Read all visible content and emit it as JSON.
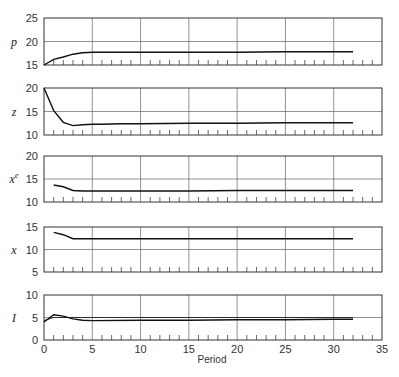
{
  "chart_data": [
    {
      "type": "line",
      "ylabel": "p",
      "ylim": [
        15,
        25
      ],
      "yticks": [
        15,
        20,
        25
      ],
      "xlim": [
        0,
        35
      ],
      "x": [
        0,
        1,
        2,
        3,
        4,
        5,
        6,
        8,
        10,
        15,
        20,
        25,
        30,
        32
      ],
      "values": [
        15.0,
        16.2,
        16.7,
        17.3,
        17.6,
        17.7,
        17.7,
        17.7,
        17.7,
        17.7,
        17.7,
        17.8,
        17.8,
        17.8
      ],
      "grid": true
    },
    {
      "type": "line",
      "ylabel": "z",
      "ylim": [
        10,
        20
      ],
      "yticks": [
        10,
        15,
        20
      ],
      "xlim": [
        0,
        35
      ],
      "x": [
        0,
        1,
        2,
        3,
        4,
        5,
        6,
        8,
        10,
        15,
        20,
        25,
        30,
        32
      ],
      "values": [
        20.0,
        15.2,
        12.7,
        12.0,
        12.2,
        12.3,
        12.3,
        12.4,
        12.4,
        12.5,
        12.5,
        12.6,
        12.6,
        12.6
      ],
      "grid": true
    },
    {
      "type": "line",
      "ylabel": "x^e",
      "ylim": [
        10,
        20
      ],
      "yticks": [
        10,
        15,
        20
      ],
      "xlim": [
        0,
        35
      ],
      "x": [
        1,
        2,
        3,
        4,
        5,
        10,
        15,
        20,
        25,
        30,
        32
      ],
      "values": [
        13.7,
        13.3,
        12.5,
        12.4,
        12.4,
        12.4,
        12.4,
        12.5,
        12.5,
        12.5,
        12.5
      ],
      "grid": true
    },
    {
      "type": "line",
      "ylabel": "x",
      "ylim": [
        5,
        15
      ],
      "yticks": [
        5,
        10,
        15
      ],
      "xlim": [
        0,
        35
      ],
      "x": [
        1,
        2,
        3,
        4,
        5,
        10,
        15,
        20,
        25,
        30,
        32
      ],
      "values": [
        13.8,
        13.3,
        12.4,
        12.4,
        12.4,
        12.4,
        12.4,
        12.4,
        12.4,
        12.4,
        12.4
      ],
      "grid": true
    },
    {
      "type": "line",
      "ylabel": "I",
      "ylim": [
        0,
        10
      ],
      "yticks": [
        0,
        5,
        10
      ],
      "xlim": [
        0,
        35
      ],
      "xlabel": "Period",
      "xticks": [
        0,
        5,
        10,
        15,
        20,
        25,
        30,
        35
      ],
      "series": [
        {
          "name": "I",
          "x": [
            0,
            1,
            2,
            3,
            4,
            5,
            10,
            15,
            20,
            25,
            30,
            32
          ],
          "values": [
            4.0,
            5.6,
            5.3,
            4.7,
            4.4,
            4.3,
            4.4,
            4.4,
            4.5,
            4.5,
            4.6,
            4.6
          ]
        },
        {
          "name": "reference",
          "x": [
            0,
            1,
            32
          ],
          "values": [
            4.3,
            5.0,
            5.0
          ]
        }
      ],
      "grid": true
    }
  ],
  "axis": {
    "xlabel": "Period",
    "xticks": [
      "0",
      "5",
      "10",
      "15",
      "20",
      "25",
      "30",
      "35"
    ]
  },
  "panels": [
    {
      "label": "p",
      "yticks": [
        "25",
        "20",
        "15"
      ]
    },
    {
      "label": "z",
      "yticks": [
        "20",
        "15",
        "10"
      ]
    },
    {
      "label": "x",
      "sup": "e",
      "yticks": [
        "20",
        "15",
        "10"
      ]
    },
    {
      "label": "x",
      "yticks": [
        "15",
        "10",
        "5"
      ]
    },
    {
      "label": "I",
      "yticks": [
        "10",
        "5",
        "0"
      ]
    }
  ]
}
